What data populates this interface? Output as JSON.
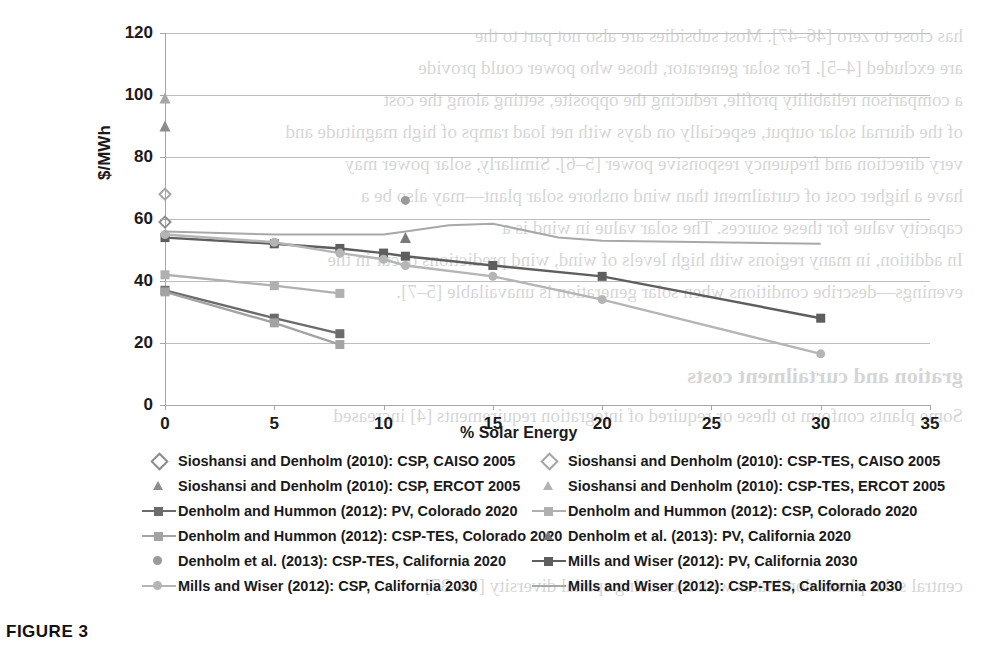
{
  "caption": "FIGURE 3",
  "chart_data": {
    "type": "line",
    "title": "",
    "xlabel": "% Solar Energy",
    "ylabel": "$/MWh",
    "xlim": [
      0,
      35
    ],
    "ylim": [
      0,
      120
    ],
    "xticks": [
      0,
      5,
      10,
      15,
      20,
      25,
      30,
      35
    ],
    "yticks": [
      0,
      20,
      40,
      60,
      80,
      100,
      120
    ],
    "grid": true,
    "legend_position": "bottom",
    "series": [
      {
        "name": "Sioshansi and Denholm (2010): CSP, CAISO 2005",
        "marker": "diamond",
        "line": "none",
        "color": "#8c8c8c",
        "x": [
          0
        ],
        "y": [
          59
        ]
      },
      {
        "name": "Sioshansi and Denholm (2010): CSP-TES, CAISO 2005",
        "marker": "diamond",
        "line": "none",
        "color": "#a6a6a6",
        "x": [
          0
        ],
        "y": [
          68
        ]
      },
      {
        "name": "Sioshansi and Denholm (2010): CSP, ERCOT 2005",
        "marker": "triangle",
        "line": "none",
        "color": "#8c8c8c",
        "x": [
          0
        ],
        "y": [
          90
        ]
      },
      {
        "name": "Sioshansi and Denholm (2010): CSP-TES, ERCOT 2005",
        "marker": "triangle",
        "line": "none",
        "color": "#a6a6a6",
        "x": [
          0
        ],
        "y": [
          99
        ]
      },
      {
        "name": "Denholm and Hummon (2012): PV, Colorado 2020",
        "marker": "square",
        "line": "solid",
        "color": "#6b6b6b",
        "x": [
          0,
          5,
          8
        ],
        "y": [
          37,
          28,
          23
        ]
      },
      {
        "name": "Denholm and Hummon (2012): CSP, Colorado 2020",
        "marker": "square",
        "line": "solid",
        "color": "#b0b0b0",
        "x": [
          0,
          5,
          8
        ],
        "y": [
          42,
          38.5,
          36
        ]
      },
      {
        "name": "Denholm and Hummon (2012): CSP-TES, Colorado 2020",
        "marker": "square",
        "line": "solid",
        "color": "#a3a3a3",
        "x": [
          0,
          5,
          8
        ],
        "y": [
          36.5,
          26.5,
          19.5
        ]
      },
      {
        "name": "Denholm et al. (2013): PV, California 2020",
        "marker": "triangle",
        "line": "none",
        "color": "#7a7a7a",
        "x": [
          11
        ],
        "y": [
          54
        ]
      },
      {
        "name": "Denholm et al. (2013): CSP-TES, California 2020",
        "marker": "circle",
        "line": "none",
        "color": "#9a9a9a",
        "x": [
          11
        ],
        "y": [
          66
        ]
      },
      {
        "name": "Mills and Wiser (2012): PV, California 2030",
        "marker": "square",
        "line": "solid",
        "color": "#5e5e5e",
        "x": [
          0,
          5,
          8,
          10,
          11,
          15,
          20,
          30
        ],
        "y": [
          54,
          52,
          50.5,
          49,
          48,
          45,
          41.5,
          28
        ]
      },
      {
        "name": "Mills and Wiser (2012): CSP, California 2030",
        "marker": "circle",
        "line": "solid",
        "color": "#b5b5b5",
        "x": [
          0,
          5,
          8,
          10,
          11,
          15,
          20,
          30
        ],
        "y": [
          55,
          52.5,
          49,
          47,
          45,
          41.5,
          34,
          16.5
        ]
      },
      {
        "name": "Mills and Wiser (2012): CSP-TES, California 2030",
        "marker": "none",
        "line": "solid",
        "color": "#a8a8a8",
        "x": [
          0,
          5,
          8,
          10,
          11,
          13,
          15,
          18,
          20,
          25,
          30
        ],
        "y": [
          56,
          55,
          55,
          55,
          56,
          58,
          58.5,
          54,
          53,
          52.5,
          52
        ]
      }
    ]
  },
  "legend": {
    "left_column": [
      {
        "label": "Sioshansi and Denholm (2010): CSP, CAISO 2005",
        "key": "diamond",
        "color": "#8c8c8c"
      },
      {
        "label": "Sioshansi and Denholm (2010): CSP, ERCOT 2005",
        "key": "triangle",
        "color": "#8c8c8c"
      },
      {
        "label": "Denholm and Hummon (2012): PV, Colorado 2020",
        "key": "line-square",
        "color": "#6b6b6b"
      },
      {
        "label": "Denholm and Hummon (2012): CSP-TES, Colorado 2020",
        "key": "line-square",
        "color": "#a3a3a3"
      },
      {
        "label": "Denholm et al. (2013): CSP-TES, California 2020",
        "key": "circle",
        "color": "#9a9a9a"
      },
      {
        "label": "Mills and Wiser (2012): CSP, California 2030",
        "key": "line-circle",
        "color": "#b5b5b5"
      }
    ],
    "right_column": [
      {
        "label": "Sioshansi and Denholm (2010): CSP-TES, CAISO 2005",
        "key": "diamond",
        "color": "#a6a6a6"
      },
      {
        "label": "Sioshansi and Denholm (2010): CSP-TES, ERCOT 2005",
        "key": "triangle",
        "color": "#b3b3b3"
      },
      {
        "label": "Denholm and Hummon (2012): CSP, Colorado 2020",
        "key": "line-square",
        "color": "#b0b0b0"
      },
      {
        "label": "Denholm et al. (2013): PV, California 2020",
        "key": "triangle",
        "color": "#7a7a7a"
      },
      {
        "label": "Mills and Wiser (2012): PV, California 2030",
        "key": "line-square",
        "color": "#5e5e5e"
      },
      {
        "label": "Mills and Wiser (2012): CSP-TES, California 2030",
        "key": "line",
        "color": "#a8a8a8"
      }
    ]
  },
  "ghost_text": {
    "lines": [
      "has close to zero [46–47]. Most subsidies are also not part to the",
      "are excluded [4–5]. For solar generator, those who power could provide",
      "a comparison reliability profile, reducing the opposite, setting along the cost",
      "of the diurnal solar output, especially on days with net load ramps of high magnitude and",
      "very direction and frequency responsive power [5–6]. Similarly, solar power may",
      "have a higher cost of curtailment than wind onshore solar plant—may also be a",
      "capacity value for these sources. The solar value in wind is a",
      "In addition, in many regions with high levels of wind, wind predictions occur in the",
      "evenings—describe conditions when solar generation is unavailable [5–7]."
    ],
    "bold_lines": [
      "gration and curtailment costs",
      "Some plants conform to these or required of integration requirements [4] increased",
      "central solar plants dominates with increasing spatial diversity [36–37]."
    ]
  }
}
